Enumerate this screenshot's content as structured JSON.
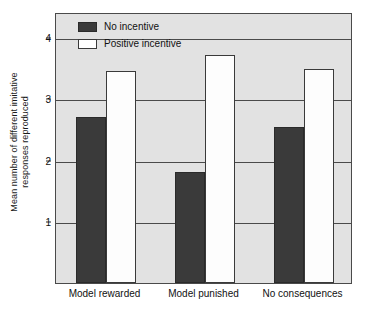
{
  "chart_data": {
    "type": "bar",
    "title": "",
    "xlabel": "",
    "ylabel_line1": "Mean number of different imitative",
    "ylabel_line2": "responses reproduced",
    "ylabel": "Mean number of different imitative responses reproduced",
    "categories": [
      "Model rewarded",
      "Model punished",
      "No consequences"
    ],
    "series": [
      {
        "name": "No incentive",
        "color": "#3a3a3a",
        "values": [
          2.7,
          1.8,
          2.53
        ]
      },
      {
        "name": "Positive incentive",
        "color": "#ffffff",
        "values": [
          3.45,
          3.7,
          3.47
        ]
      }
    ],
    "ylim": [
      0,
      4.4
    ],
    "yticks": [
      1,
      2,
      3,
      4
    ],
    "ytick_labels": [
      "1",
      "2",
      "3",
      "4"
    ],
    "grid": true,
    "legend_position": "top-left-inside",
    "plot_background": "#e2e2e2",
    "axis_color": "#4a4a4a"
  },
  "legend": {
    "items": [
      {
        "label": "No incentive",
        "swatch": "dark-swatch"
      },
      {
        "label": "Positive incentive",
        "swatch": "light-swatch"
      }
    ]
  }
}
